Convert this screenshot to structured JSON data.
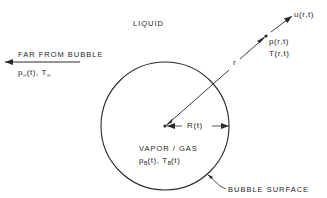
{
  "diagram": {
    "labels": {
      "liquid": "LIQUID",
      "far_from_bubble": "FAR FROM BUBBLE",
      "far_p": "p",
      "far_p_sub": "∞",
      "far_p_arg": "(t), T",
      "far_T_sub": "∞",
      "velocity": "u(r,t)",
      "pressure": "p(r,t)",
      "temperature": "T(r,t)",
      "radial_coord": "r",
      "bubble_radius": "R(t)",
      "vapor_gas": "VAPOR / GAS",
      "bubble_p": "p",
      "bubble_p_sub": "B",
      "bubble_p_arg": "(t), T",
      "bubble_T_sub": "B",
      "bubble_T_arg": "(t)",
      "bubble_surface": "BUBBLE SURFACE"
    },
    "geometry": {
      "bubble_center": [
        165,
        126
      ],
      "bubble_radius_px": 64,
      "point_p": [
        266,
        36
      ],
      "velocity_arrow_tip": [
        292,
        16
      ]
    },
    "colors": {
      "line": "#2a2a2a",
      "background": "#ffffff"
    }
  }
}
